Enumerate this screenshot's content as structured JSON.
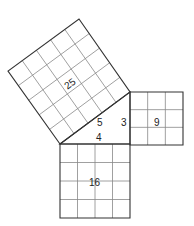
{
  "diagram": {
    "triangle": {
      "vertices": [
        [
          60,
          144
        ],
        [
          130,
          92
        ],
        [
          130,
          144
        ]
      ],
      "side_labels": {
        "hypotenuse": "5",
        "vertical": "3",
        "horizontal": "4"
      }
    },
    "squares": [
      {
        "name": "square-25",
        "label": "25",
        "units": 5,
        "corners": [
          [
            60,
            144
          ],
          [
            130,
            92
          ],
          [
            79,
            19
          ],
          [
            8,
            71
          ]
        ]
      },
      {
        "name": "square-9",
        "label": "9",
        "units": 3,
        "corners": [
          [
            130,
            92
          ],
          [
            183,
            92
          ],
          [
            183,
            145
          ],
          [
            130,
            145
          ]
        ]
      },
      {
        "name": "square-16",
        "label": "16",
        "units": 4,
        "corners": [
          [
            60,
            144
          ],
          [
            130,
            144
          ],
          [
            130,
            218
          ],
          [
            60,
            218
          ]
        ]
      }
    ],
    "stroke_color": "#333333",
    "grid_color": "#888888"
  }
}
